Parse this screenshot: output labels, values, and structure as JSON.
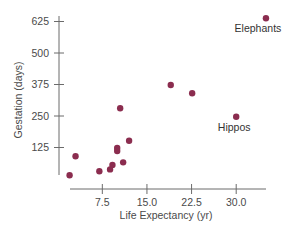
{
  "chart_data": {
    "type": "scatter",
    "title": "",
    "xlabel": "Life Expectancy (yr)",
    "ylabel": "Gestation (days)",
    "xlim": [
      -1,
      39
    ],
    "ylim": [
      0,
      625
    ],
    "x_ticks": [
      7.5,
      15.0,
      22.5,
      30.0
    ],
    "x_tick_labels": [
      "7.5",
      "15.0",
      "22.5",
      "30.0"
    ],
    "y_ticks": [
      125,
      250,
      375,
      500,
      625
    ],
    "y_tick_labels": [
      "125",
      "250",
      "375",
      "500",
      "625"
    ],
    "grid": false,
    "legend": null,
    "marker_color": "#8B2D4F",
    "points": [
      {
        "x": 2,
        "y": 15
      },
      {
        "x": 3,
        "y": 90
      },
      {
        "x": 7,
        "y": 31
      },
      {
        "x": 8.8,
        "y": 38
      },
      {
        "x": 9.2,
        "y": 56
      },
      {
        "x": 10,
        "y": 123
      },
      {
        "x": 10,
        "y": 111
      },
      {
        "x": 10.5,
        "y": 281
      },
      {
        "x": 11,
        "y": 66
      },
      {
        "x": 12,
        "y": 152
      },
      {
        "x": 19,
        "y": 373
      },
      {
        "x": 22.6,
        "y": 340
      },
      {
        "x": 30,
        "y": 247,
        "label": "Hippos"
      },
      {
        "x": 35,
        "y": 638,
        "label": "Elephants"
      }
    ],
    "annotations": [
      {
        "text": "Elephants",
        "x": 35,
        "y": 638
      },
      {
        "text": "Hippos",
        "x": 30,
        "y": 247
      }
    ]
  }
}
